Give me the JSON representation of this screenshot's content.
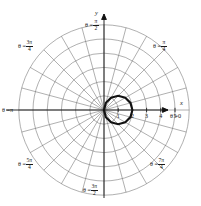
{
  "figure": {
    "background_color": "#ffffff",
    "grid_color": "#6e6e6e",
    "axis_color": "#111111",
    "curve_color": "#111111"
  },
  "axes": {
    "x_axis_name": "x",
    "y_axis_name": "y",
    "x_tick_labels": [
      "1",
      "2",
      "3",
      "4",
      "5"
    ],
    "x_tick_values": [
      1,
      2,
      3,
      4,
      5
    ]
  },
  "angle_labels": [
    {
      "id": "theta-0",
      "prefix": "θ =",
      "value": "0",
      "kind": "plain",
      "deg": 0
    },
    {
      "id": "theta-pi-4",
      "prefix": "θ =",
      "num": "π",
      "den": "4",
      "kind": "frac",
      "deg": 45
    },
    {
      "id": "theta-pi-2",
      "prefix": "θ =",
      "num": "π",
      "den": "2",
      "kind": "frac",
      "deg": 90
    },
    {
      "id": "theta-3pi-4",
      "prefix": "θ =",
      "num": "3π",
      "den": "4",
      "kind": "frac",
      "deg": 135
    },
    {
      "id": "theta-pi",
      "prefix": "θ =",
      "value": "π",
      "kind": "plain",
      "deg": 180
    },
    {
      "id": "theta-5pi-4",
      "prefix": "θ =",
      "num": "5π",
      "den": "4",
      "kind": "frac",
      "deg": 225
    },
    {
      "id": "theta-3pi-2",
      "prefix": "θ =",
      "num": "3π",
      "den": "2",
      "kind": "frac",
      "deg": 270
    },
    {
      "id": "theta-7pi-4",
      "prefix": "θ =",
      "num": "7π",
      "den": "4",
      "kind": "frac",
      "deg": 315
    }
  ],
  "chart_data": {
    "type": "line",
    "coordinate_system": "polar",
    "title": "",
    "xlabel": "x",
    "ylabel": "y",
    "grid": true,
    "legend": null,
    "polar_grid": {
      "radial_circles_r": [
        1,
        2,
        3,
        4,
        5,
        6
      ],
      "radial_circle_count": 6,
      "spoke_count": 24,
      "spoke_step_degrees": 15,
      "r_max": 6,
      "labeled_rays_degrees": [
        0,
        45,
        90,
        135,
        180,
        225,
        270,
        315
      ]
    },
    "series": [
      {
        "name": "r = 2 cos(theta)",
        "equation": "r = 2cosθ",
        "shape": "circle",
        "center_xy": [
          1,
          0
        ],
        "radius": 1,
        "r_max": 2,
        "theta_range_degrees": [
          -90,
          90
        ],
        "points_polar": [
          {
            "theta_deg": -90,
            "r": 0.0
          },
          {
            "theta_deg": -75,
            "r": 0.52
          },
          {
            "theta_deg": -60,
            "r": 1.0
          },
          {
            "theta_deg": -45,
            "r": 1.41
          },
          {
            "theta_deg": -30,
            "r": 1.73
          },
          {
            "theta_deg": -15,
            "r": 1.93
          },
          {
            "theta_deg": 0,
            "r": 2.0
          },
          {
            "theta_deg": 15,
            "r": 1.93
          },
          {
            "theta_deg": 30,
            "r": 1.73
          },
          {
            "theta_deg": 45,
            "r": 1.41
          },
          {
            "theta_deg": 60,
            "r": 1.0
          },
          {
            "theta_deg": 75,
            "r": 0.52
          },
          {
            "theta_deg": 90,
            "r": 0.0
          }
        ]
      }
    ]
  }
}
